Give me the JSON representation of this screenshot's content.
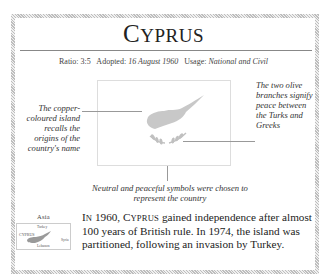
{
  "title": {
    "first": "C",
    "rest": "YPRUS"
  },
  "meta": {
    "ratio_label": "Ratio:",
    "ratio_value": "3:5",
    "adopted_label": "Adopted:",
    "adopted_value": "16 August 1960",
    "usage_label": "Usage:",
    "usage_value": "National and Civil"
  },
  "flag": {
    "background": "#ffffff",
    "island_color": "#c8c8c8",
    "branches_color": "#c0c0c0"
  },
  "annotations": {
    "left": "The copper-coloured island recalls the origins of the country's name",
    "right": "The two olive branches signify peace between the Turks and Greeks",
    "bottom": "Neutral and peaceful symbols were chosen to represent the country"
  },
  "inset_map": {
    "region": "Asia",
    "labels": {
      "north": "Turkey",
      "country": "CYPRUS",
      "east": "Syria",
      "south": "Lebanon"
    }
  },
  "body": {
    "in_first": "I",
    "in_rest": "N",
    "year_part": " 1960, ",
    "country_first": "C",
    "country_rest": "YPRUS",
    "rest": " gained independence after almost 100 years of British rule. In 1974, the island was partitioned, following an invasion by Turkey."
  }
}
